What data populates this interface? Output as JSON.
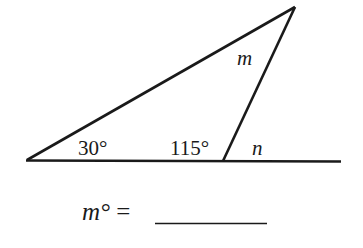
{
  "diagram": {
    "angles": {
      "left_angle": "30°",
      "interior_angle": "115°",
      "top_angle_label": "m",
      "exterior_angle_label": "n"
    },
    "question": {
      "prefix": "m°",
      "equals": "=",
      "answer": ""
    },
    "colors": {
      "stroke": "#1a1a1a",
      "background": "#ffffff"
    }
  }
}
